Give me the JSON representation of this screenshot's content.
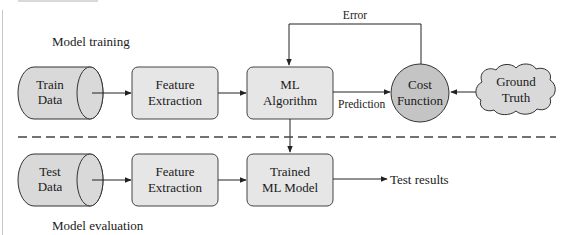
{
  "diagram": {
    "type": "ml-pipeline-flowchart",
    "sections": {
      "training": {
        "label": "Model training"
      },
      "evaluation": {
        "label": "Model evaluation"
      }
    },
    "nodes": {
      "train_data": {
        "line1": "Train",
        "line2": "Data",
        "shape": "cylinder"
      },
      "feature_extraction_train": {
        "line1": "Feature",
        "line2": "Extraction",
        "shape": "rounded-rect"
      },
      "ml_algorithm": {
        "line1": "ML",
        "line2": "Algorithm",
        "shape": "rounded-rect"
      },
      "cost_function": {
        "line1": "Cost",
        "line2": "Function",
        "shape": "circle"
      },
      "ground_truth": {
        "line1": "Ground",
        "line2": "Truth",
        "shape": "cloud"
      },
      "test_data": {
        "line1": "Test",
        "line2": "Data",
        "shape": "cylinder"
      },
      "feature_extraction_test": {
        "line1": "Feature",
        "line2": "Extraction",
        "shape": "rounded-rect"
      },
      "trained_model": {
        "line1": "Trained",
        "line2": "ML Model",
        "shape": "rounded-rect"
      }
    },
    "edges": {
      "error": {
        "label": "Error",
        "from": "cost_function",
        "to": "ml_algorithm"
      },
      "prediction": {
        "label": "Prediction",
        "from": "ml_algorithm",
        "to": "cost_function"
      },
      "test_results": {
        "label": "Test results",
        "from": "trained_model"
      }
    },
    "colors": {
      "box_fill": "#e6e6e6",
      "circle_fill": "#c4c4c4",
      "cylinder_fill": "#d9d9d9",
      "cloud_fill": "#d9d9d9",
      "stroke": "#333333",
      "divider": "#444444"
    }
  }
}
